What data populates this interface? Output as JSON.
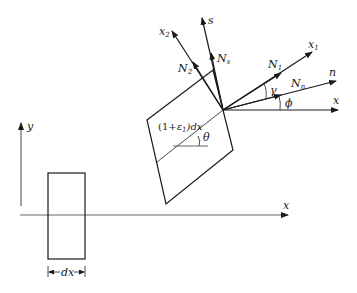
{
  "figure": {
    "colors": {
      "ink": "#1a1a1a",
      "background": "#ffffff"
    }
  },
  "reference_frame": {
    "x_axis_label": "x",
    "y_axis_label": "y",
    "element_width_label": "dx"
  },
  "deformed_element": {
    "length_label": "(1+ε₁)dx",
    "length_label_main": "(1+",
    "length_label_eps": "ε",
    "length_label_eps_sub": "1",
    "length_label_tail": ")dx",
    "rotation_angle_label": "θ"
  },
  "force_diagram": {
    "axes": [
      {
        "id": "x1",
        "label": "x",
        "subscript": "1"
      },
      {
        "id": "x2",
        "label": "x",
        "subscript": "2"
      },
      {
        "id": "n",
        "label": "n",
        "subscript": ""
      },
      {
        "id": "s",
        "label": "s",
        "subscript": ""
      },
      {
        "id": "x",
        "label": "x",
        "subscript": ""
      }
    ],
    "forces": [
      {
        "id": "N1",
        "label": "N",
        "subscript": "1"
      },
      {
        "id": "N2",
        "label": "N",
        "subscript": "2"
      },
      {
        "id": "Nn",
        "label": "N",
        "subscript": "n"
      },
      {
        "id": "Ns",
        "label": "N",
        "subscript": "s"
      }
    ],
    "angles": [
      {
        "id": "gamma",
        "label": "γ"
      },
      {
        "id": "phi",
        "label": "ϕ"
      }
    ]
  }
}
